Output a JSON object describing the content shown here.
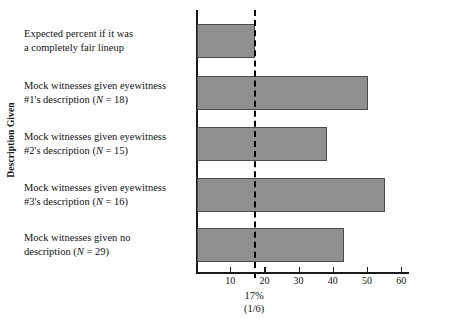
{
  "chart_data": {
    "type": "bar",
    "orientation": "horizontal",
    "title": "",
    "xlabel": "",
    "ylabel": "Description Given",
    "xlim": [
      0,
      62
    ],
    "xticks": [
      10,
      20,
      30,
      40,
      50,
      60
    ],
    "xtick_labels": [
      "10",
      "20",
      "30",
      "40",
      "50",
      "60"
    ],
    "grid": false,
    "legend": null,
    "categories": [
      "Expected percent if it was a completely fair lineup",
      "Mock witnesses given eyewitness #1's description (N = 18)",
      "Mock witnesses given eyewitness #2's description (N = 15)",
      "Mock witnesses given eyewitness #3's description (N = 16)",
      "Mock witnesses given no description (N = 29)"
    ],
    "values": [
      17,
      50,
      38,
      55,
      43
    ],
    "bar_color": "#8f8f8f",
    "bar_edge_color": "#4a4a4a",
    "annotations": [
      {
        "name": "fair-lineup-threshold",
        "x": 17,
        "line_style": "dashed",
        "label_line1": "17%",
        "label_line2": "(1/6)"
      }
    ]
  },
  "axis": {
    "y_title": "Description Given",
    "x_ticks": [
      {
        "value": 10,
        "label": "10"
      },
      {
        "value": 20,
        "label": "20"
      },
      {
        "value": 30,
        "label": "30"
      },
      {
        "value": 40,
        "label": "40"
      },
      {
        "value": 50,
        "label": "50"
      },
      {
        "value": 60,
        "label": "60"
      }
    ]
  },
  "categories": [
    {
      "line1": "Expected percent if it was",
      "line2": "a completely fair lineup",
      "line2_italic": ""
    },
    {
      "line1": "Mock witnesses given eyewitness",
      "line2": "#1's description  (",
      "line2_italic": "N",
      "line2_tail": " = 18)"
    },
    {
      "line1": "Mock witnesses given eyewitness",
      "line2": "#2's description  (",
      "line2_italic": "N",
      "line2_tail": " = 15)"
    },
    {
      "line1": "Mock witnesses given eyewitness",
      "line2": "#3's description  (",
      "line2_italic": "N",
      "line2_tail": " = 16)"
    },
    {
      "line1": "Mock witnesses given no",
      "line2": "description  (",
      "line2_italic": "N",
      "line2_tail": " = 29)"
    }
  ],
  "threshold": {
    "percent_label": "17%",
    "fraction_label": "(1/6)"
  }
}
